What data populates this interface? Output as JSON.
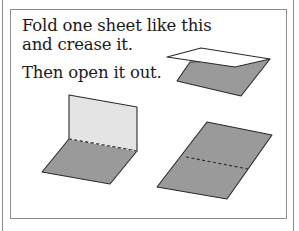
{
  "instructions": {
    "line1": "Fold one sheet like this",
    "line2": "and crease it.",
    "line3": "Then open it out."
  },
  "figures": [
    {
      "name": "folded-sheet",
      "description": "sheet folded in half, top half white, bottom gray"
    },
    {
      "name": "opened-sheet-upright",
      "description": "sheet opened to 90 degrees with dashed crease"
    },
    {
      "name": "opened-sheet-flat",
      "description": "sheet laid flat with dashed crease line"
    }
  ],
  "colors": {
    "sheet_gray": "#9a9a9a",
    "sheet_light": "#e4e4e4",
    "sheet_white": "#ffffff",
    "outline": "#2a2a2a",
    "border": "#8c8c8c"
  }
}
